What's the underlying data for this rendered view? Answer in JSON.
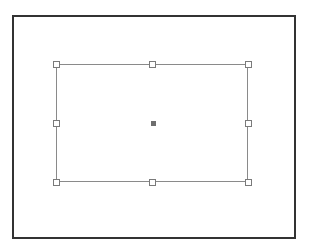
{
  "canvas": {
    "frame": {
      "left": 12,
      "top": 15,
      "width": 280,
      "height": 220,
      "border_color": "#333333"
    },
    "selection": {
      "left": 56,
      "top": 64,
      "width": 192,
      "height": 118,
      "border_color": "#8a8a8a",
      "handles": [
        {
          "id": "top-left",
          "x": 56,
          "y": 64
        },
        {
          "id": "top-center",
          "x": 152,
          "y": 64
        },
        {
          "id": "top-right",
          "x": 248,
          "y": 64
        },
        {
          "id": "middle-left",
          "x": 56,
          "y": 123
        },
        {
          "id": "middle-right",
          "x": 248,
          "y": 123
        },
        {
          "id": "bottom-left",
          "x": 56,
          "y": 182
        },
        {
          "id": "bottom-center",
          "x": 152,
          "y": 182
        },
        {
          "id": "bottom-right",
          "x": 248,
          "y": 182
        }
      ],
      "center_anchor": {
        "x": 153,
        "y": 123,
        "color": "#6e6e6e"
      }
    }
  }
}
